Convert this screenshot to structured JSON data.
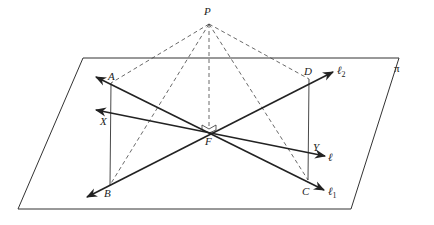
{
  "figure": {
    "colors": {
      "line": "#222222",
      "plane": "#333333",
      "dashed": "#444444"
    },
    "labels": {
      "P": "P",
      "A": "A",
      "D": "D",
      "B": "B",
      "C": "C",
      "F": "F",
      "X": "X",
      "Y": "Y",
      "pi": "π",
      "l": "ℓ",
      "l1": "ℓ",
      "l1_sub": "1",
      "l2": "ℓ",
      "l2_sub": "2"
    }
  }
}
